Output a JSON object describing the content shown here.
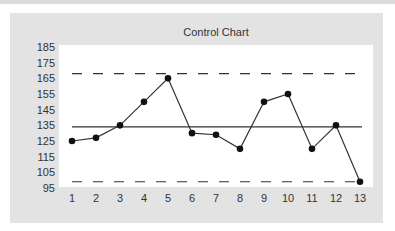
{
  "chart_data": {
    "type": "line",
    "title": "Control Chart",
    "xlabel": "",
    "ylabel": "",
    "categories": [
      "1",
      "2",
      "3",
      "4",
      "5",
      "6",
      "7",
      "8",
      "9",
      "10",
      "11",
      "12",
      "13"
    ],
    "series": [
      {
        "name": "Measurements",
        "values": [
          125,
          127,
          135,
          150,
          165,
          130,
          129,
          120,
          150,
          155,
          120,
          135,
          99
        ]
      }
    ],
    "reference_lines": [
      {
        "name": "UCL",
        "value": 168,
        "style": "dashed"
      },
      {
        "name": "Center Line",
        "value": 134,
        "style": "solid"
      },
      {
        "name": "LCL",
        "value": 99,
        "style": "dashed"
      }
    ],
    "yticks": [
      185,
      175,
      165,
      155,
      145,
      135,
      125,
      115,
      105,
      95
    ],
    "ylim": [
      95,
      185
    ],
    "grid": false,
    "legend": "none"
  },
  "colors": {
    "panel": "#e3e3e3",
    "plot_area": "#ffffff",
    "line": "#333333",
    "marker": "#111111"
  }
}
